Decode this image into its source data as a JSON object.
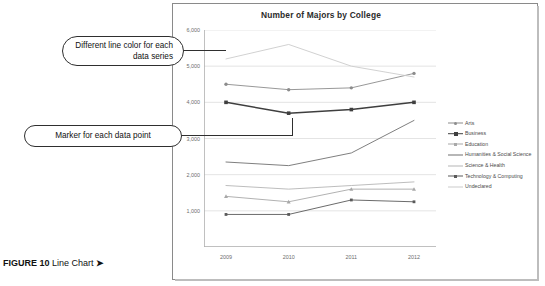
{
  "figure": {
    "label": "FIGURE 10",
    "title": "Line Chart",
    "arrow": "➤"
  },
  "callouts": [
    {
      "name": "line-color-callout",
      "text": "Different line color for each data series"
    },
    {
      "name": "marker-callout",
      "text": "Marker for each data point"
    }
  ],
  "chart_data": {
    "type": "line",
    "title": "Number of Majors by College",
    "xlabel": "",
    "ylabel": "",
    "x": [
      "2009",
      "2010",
      "2011",
      "2012"
    ],
    "categories": [
      "2009",
      "2010",
      "2011",
      "2012"
    ],
    "ylim": [
      0,
      6000
    ],
    "yticks": [
      1000,
      2000,
      3000,
      4000,
      5000,
      6000
    ],
    "ytick_labels": [
      "1,000",
      "2,000",
      "3,000",
      "4,000",
      "5,000",
      "6,000"
    ],
    "grid": "horizontal",
    "legend_position": "right",
    "series": [
      {
        "name": "Arts",
        "values": [
          4500,
          4350,
          4400,
          4800
        ],
        "color": "#8c8c8c",
        "marker": "circle"
      },
      {
        "name": "Business",
        "values": [
          4000,
          3700,
          3800,
          4000
        ],
        "color": "#3f3f3f",
        "marker": "square"
      },
      {
        "name": "Education",
        "values": [
          1400,
          1250,
          1600,
          1600
        ],
        "color": "#a8a8a8",
        "marker": "triangle"
      },
      {
        "name": "Humanities & Social Science",
        "values": [
          2350,
          2250,
          2600,
          3500
        ],
        "color": "#707070",
        "marker": "none"
      },
      {
        "name": "Science & Health",
        "values": [
          1700,
          1600,
          1700,
          1800
        ],
        "color": "#b5b5b5",
        "marker": "none"
      },
      {
        "name": "Technology & Computing",
        "values": [
          900,
          900,
          1300,
          1250
        ],
        "color": "#5a5a5a",
        "marker": "square"
      },
      {
        "name": "Undeclared",
        "values": [
          5200,
          5600,
          5000,
          4700
        ],
        "color": "#cccccc",
        "marker": "none"
      }
    ]
  }
}
